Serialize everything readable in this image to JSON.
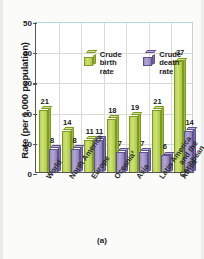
{
  "caption": "(a)",
  "axis": {
    "ylabel": "Rate (per 1,000 population)",
    "yticks": [
      "0",
      "10",
      "20",
      "30",
      "40",
      "50"
    ]
  },
  "legend": {
    "items": [
      {
        "name": "crude-birth-rate",
        "line1": "Crude",
        "line2": "birth rate",
        "color": "#b6d44e"
      },
      {
        "name": "crude-death-rate",
        "line1": "Crude",
        "line2": "death rate",
        "color": "#9b8ec4"
      }
    ]
  },
  "chart_data": {
    "type": "bar",
    "title": "",
    "xlabel": "",
    "ylabel": "Rate (per 1,000 population)",
    "ylim": [
      0,
      50
    ],
    "yticks": [
      0,
      10,
      20,
      30,
      40,
      50
    ],
    "grid": true,
    "legend_position": "top-left-inside",
    "categories": [
      "World",
      "North America¹",
      "Europe",
      "Oceania²",
      "Asia",
      "Latin America\nand the\nCaribbean",
      "Africa"
    ],
    "series": [
      {
        "name": "Crude birth rate",
        "color": "#b6d44e",
        "values": [
          21,
          14,
          11,
          18,
          19,
          21,
          37
        ]
      },
      {
        "name": "Crude death rate",
        "color": "#9b8ec4",
        "values": [
          8,
          8,
          11,
          7,
          7,
          6,
          14
        ]
      }
    ]
  }
}
